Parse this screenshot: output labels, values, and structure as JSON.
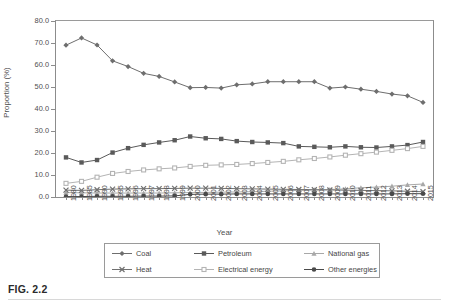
{
  "figure": {
    "caption": "FIG. 2.2"
  },
  "axes": {
    "ylabel": "Proportion (%)",
    "xlabel": "Year",
    "yticks": [
      "0.0",
      "10.0",
      "20.0",
      "30.0",
      "40.0",
      "50.0",
      "60.0",
      "70.0",
      "80.0"
    ]
  },
  "legend": {
    "items": [
      {
        "label": "Coal",
        "marker": "diamond",
        "color": "#6e6e6e"
      },
      {
        "label": "Petroleum",
        "marker": "square",
        "color": "#5a5a5a"
      },
      {
        "label": "National gas",
        "marker": "triangle",
        "color": "#a8a8a8"
      },
      {
        "label": "Heat",
        "marker": "cross",
        "color": "#707070"
      },
      {
        "label": "Electrical energy",
        "marker": "square-open",
        "color": "#b4b4b4"
      },
      {
        "label": "Other energies",
        "marker": "circle",
        "color": "#4a4a4a"
      }
    ]
  },
  "chart_data": {
    "type": "line",
    "title": "",
    "xlabel": "Year",
    "ylabel": "Proportion (%)",
    "ylim": [
      0,
      80
    ],
    "ytick_step": 10,
    "grid": false,
    "legend_position": "bottom",
    "categories": [
      "1980",
      "1985",
      "1990",
      "1995",
      "1996",
      "1997",
      "1998",
      "1999",
      "2000",
      "2001",
      "2002",
      "2003",
      "2004",
      "2005",
      "2006",
      "2007",
      "2008",
      "2009",
      "2010",
      "2011",
      "2012",
      "2013",
      "2014",
      "2015"
    ],
    "series": [
      {
        "name": "Coal",
        "marker": "diamond",
        "color": "#6e6e6e",
        "values": [
          69.0,
          72.3,
          69.1,
          61.9,
          59.3,
          56.2,
          54.8,
          52.3,
          49.7,
          49.8,
          49.5,
          51.0,
          51.4,
          52.4,
          52.4,
          52.4,
          52.4,
          49.5,
          50.0,
          49.0,
          48.0,
          46.8,
          46.0,
          43.0
        ]
      },
      {
        "name": "Petroleum",
        "marker": "square",
        "color": "#5a5a5a",
        "values": [
          18.0,
          15.7,
          16.8,
          20.2,
          22.2,
          23.7,
          24.8,
          25.8,
          27.5,
          26.7,
          26.4,
          25.4,
          25.0,
          24.8,
          24.5,
          23.0,
          22.8,
          22.6,
          23.0,
          22.6,
          22.5,
          23.0,
          23.6,
          25.0
        ]
      },
      {
        "name": "National gas",
        "marker": "triangle",
        "color": "#a8a8a8",
        "values": [
          2.0,
          1.9,
          1.8,
          1.8,
          1.8,
          1.8,
          1.8,
          1.9,
          2.0,
          2.1,
          2.2,
          2.3,
          2.4,
          2.6,
          2.8,
          3.0,
          3.2,
          3.4,
          3.7,
          4.2,
          4.5,
          4.9,
          5.5,
          5.9
        ]
      },
      {
        "name": "Heat",
        "marker": "cross",
        "color": "#707070",
        "values": [
          3.1,
          3.0,
          3.3,
          3.6,
          3.7,
          3.8,
          3.8,
          3.9,
          4.0,
          4.0,
          3.9,
          3.8,
          3.7,
          3.6,
          3.5,
          3.4,
          3.3,
          3.2,
          3.1,
          3.0,
          2.9,
          2.8,
          2.6,
          2.4
        ]
      },
      {
        "name": "Electrical energy",
        "marker": "square-open",
        "color": "#b4b4b4",
        "values": [
          6.2,
          7.1,
          9.0,
          10.7,
          11.6,
          12.3,
          12.8,
          13.2,
          13.9,
          14.4,
          14.6,
          14.8,
          15.2,
          15.7,
          16.2,
          16.9,
          17.5,
          18.2,
          19.0,
          19.7,
          20.4,
          21.2,
          22.0,
          23.0
        ]
      },
      {
        "name": "Other energies",
        "marker": "circle",
        "color": "#4a4a4a",
        "values": [
          0.2,
          0.2,
          0.3,
          0.3,
          0.3,
          0.4,
          0.4,
          0.5,
          1.2,
          1.3,
          1.3,
          1.4,
          1.4,
          1.4,
          1.4,
          1.4,
          1.4,
          1.4,
          1.4,
          1.4,
          1.4,
          1.4,
          1.5,
          1.5
        ]
      }
    ]
  }
}
